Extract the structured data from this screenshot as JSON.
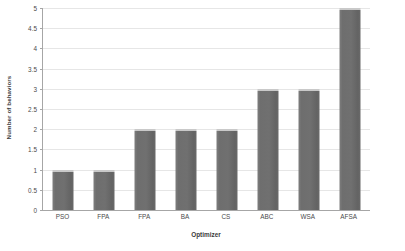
{
  "chart_data": {
    "type": "bar",
    "title": "",
    "xlabel": "Optimizer",
    "ylabel": "Number of behaviors",
    "categories": [
      "PSO",
      "FPA",
      "FPA",
      "BA",
      "CS",
      "ABC",
      "WSA",
      "AFSA"
    ],
    "values": [
      1,
      1,
      2,
      2,
      2,
      3,
      3,
      5
    ],
    "ylim": [
      0,
      5
    ],
    "yticks": [
      0,
      0.5,
      1,
      1.5,
      2,
      2.5,
      3,
      3.5,
      4,
      4.5,
      5
    ],
    "ytick_labels": [
      "0",
      "0.5",
      "1",
      "1.5",
      "2",
      "2.5",
      "3",
      "3.5",
      "4",
      "4.5",
      "5"
    ],
    "grid": "horizontal",
    "legend": "none",
    "series": [
      {
        "name": "Number of behaviors",
        "values": [
          1,
          1,
          2,
          2,
          2,
          3,
          3,
          5
        ]
      }
    ],
    "colors": {
      "bar_fill": "#6e6e6e",
      "bar_top_highlight": "#c9c9c9",
      "gridline": "#e6e6e6",
      "axis_line": "#a6a6a6",
      "text": "#4a4a4a",
      "background": "#ffffff"
    }
  }
}
